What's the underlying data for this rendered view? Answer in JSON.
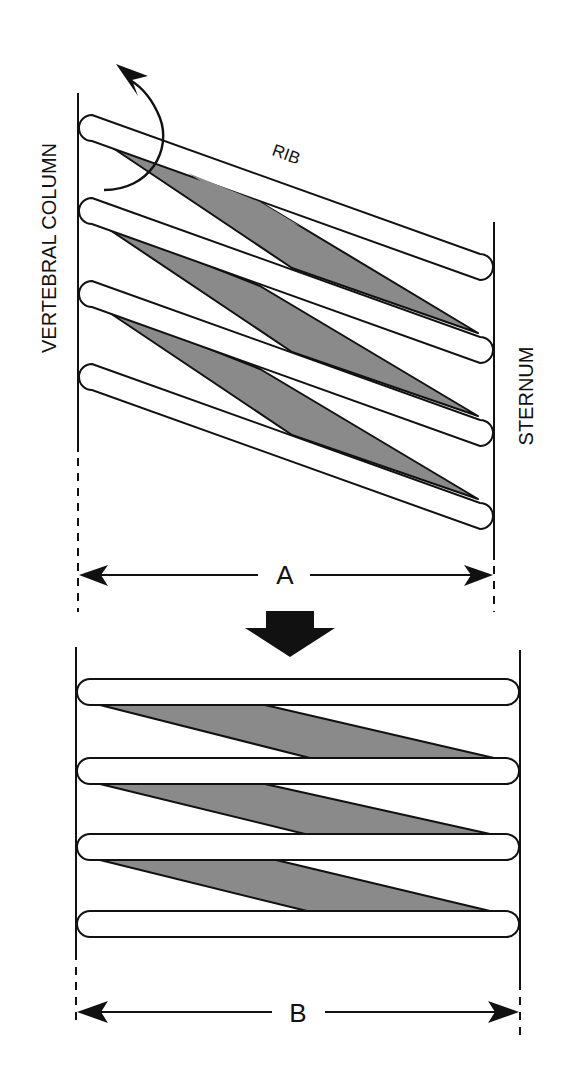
{
  "figure": {
    "top_panel": {
      "left_structure_label": "VERTEBRAL COLUMN",
      "right_structure_label": "STERNUM",
      "rib_label": "RIB",
      "rotation_arrow": "curved-arrow-rib-rotation",
      "rib_count": 4,
      "dimension_label": "A"
    },
    "transition_arrow": "down-arrow",
    "bottom_panel": {
      "rib_count": 4,
      "dimension_label": "B"
    },
    "colors": {
      "line": "#111111",
      "muscle_fill": "#8a8a8a",
      "rib_fill": "#ffffff",
      "background": "#ffffff"
    }
  }
}
